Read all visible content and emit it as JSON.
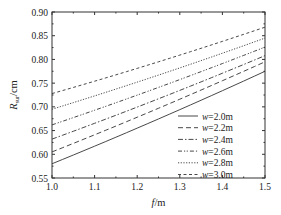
{
  "chart_data": {
    "type": "line",
    "title": "",
    "xlabel": "f/m",
    "ylabel": "R_sur/cm",
    "xlim": [
      1.0,
      1.5
    ],
    "ylim": [
      0.55,
      0.9
    ],
    "x_ticks": [
      "1.0",
      "1.1",
      "1.2",
      "1.3",
      "1.4",
      "1.5"
    ],
    "y_ticks": [
      "0.55",
      "0.60",
      "0.65",
      "0.70",
      "0.75",
      "0.80",
      "0.85",
      "0.90"
    ],
    "grid": false,
    "legend_position": "lower right",
    "x": [
      1.0,
      1.5
    ],
    "series": [
      {
        "name": "w=2.0m",
        "style": "solid",
        "values": [
          0.58,
          0.775
        ]
      },
      {
        "name": "w=2.2m",
        "style": "dashed",
        "values": [
          0.605,
          0.795
        ]
      },
      {
        "name": "w=2.4m",
        "style": "dash-dot",
        "values": [
          0.632,
          0.808
        ]
      },
      {
        "name": "w=2.6m",
        "style": "dash-dot-dot",
        "values": [
          0.662,
          0.826
        ]
      },
      {
        "name": "w=2.8m",
        "style": "dotted",
        "values": [
          0.695,
          0.845
        ]
      },
      {
        "name": "w=3.0m",
        "style": "short-dash",
        "values": [
          0.728,
          0.868
        ]
      }
    ]
  },
  "labels": {
    "xlabel_italic": "f",
    "xlabel_unit": "/m",
    "ylabel_main": "R",
    "ylabel_sub": "sur",
    "ylabel_unit": "/cm"
  }
}
